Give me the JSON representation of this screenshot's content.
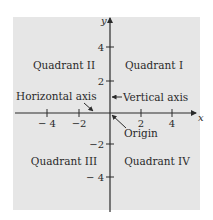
{
  "diagram": {
    "type": "cartesian-coordinate-plane",
    "background_color": "#e6e6e6",
    "line_color": "#2a2a2a",
    "axes": {
      "x_label": "x",
      "y_label": "y",
      "x_ticks": [
        {
          "value": -4,
          "label": "− 4"
        },
        {
          "value": -2,
          "label": "−2"
        },
        {
          "value": 2,
          "label": "2"
        },
        {
          "value": 4,
          "label": "4"
        }
      ],
      "y_ticks": [
        {
          "value": 4,
          "label": "4"
        },
        {
          "value": 2,
          "label": "2"
        },
        {
          "value": -2,
          "label": "−2"
        },
        {
          "value": -4,
          "label": "− 4"
        }
      ]
    },
    "quadrants": {
      "q1": "Quadrant I",
      "q2": "Quadrant II",
      "q3": "Quadrant III",
      "q4": "Quadrant IV"
    },
    "annotations": {
      "horizontal_axis": "Horizontal axis",
      "vertical_axis": "Vertical axis",
      "origin": "Origin"
    }
  }
}
